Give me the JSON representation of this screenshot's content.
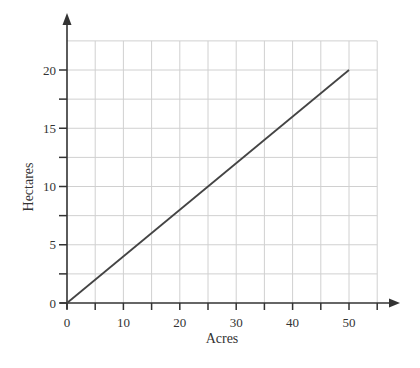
{
  "chart_data": {
    "type": "line",
    "title": "",
    "xlabel": "Acres",
    "ylabel": "Hectares",
    "xlim": [
      0,
      55
    ],
    "ylim": [
      0,
      22.5
    ],
    "x_ticks": [
      0,
      5,
      10,
      15,
      20,
      25,
      30,
      35,
      40,
      45,
      50,
      55
    ],
    "x_tick_labels": [
      "0",
      "",
      "10",
      "",
      "20",
      "",
      "30",
      "",
      "40",
      "",
      "50",
      ""
    ],
    "y_ticks": [
      0,
      2.5,
      5,
      7.5,
      10,
      12.5,
      15,
      17.5,
      20,
      22.5
    ],
    "y_tick_labels": [
      "0",
      "",
      "5",
      "",
      "10",
      "",
      "15",
      "",
      "20",
      ""
    ],
    "grid": true,
    "legend": null,
    "series": [
      {
        "name": "Acres to hectares conversion",
        "x": [
          0,
          50
        ],
        "y": [
          0,
          20
        ],
        "color": "#444444"
      }
    ]
  },
  "colors": {
    "axis": "#333333",
    "grid": "#d0d0d0",
    "line": "#444444"
  }
}
